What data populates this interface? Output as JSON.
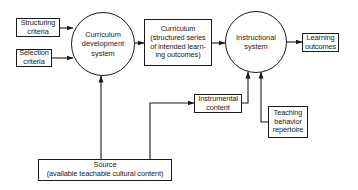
{
  "diagram": {
    "type": "flowchart",
    "nodes": {
      "structuring": {
        "shape": "box",
        "lines": [
          "Structuring",
          "criteria"
        ]
      },
      "selection": {
        "shape": "box",
        "lines": [
          "Selection",
          "criteria"
        ]
      },
      "curriculum_dev": {
        "shape": "circle",
        "lines": [
          "Curriculum",
          "development",
          "system"
        ]
      },
      "curriculum": {
        "shape": "box",
        "lines": [
          "Curriculum",
          "(structured series",
          "of intended learn-",
          "ing outcomes)"
        ]
      },
      "instructional": {
        "shape": "circle",
        "lines": [
          "Instructional",
          "system"
        ]
      },
      "learning": {
        "shape": "box",
        "lines": [
          "Learning",
          "outcomes"
        ]
      },
      "instrumental": {
        "shape": "box",
        "lines": [
          "Instrumental",
          "content"
        ]
      },
      "teaching": {
        "shape": "box",
        "lines": [
          "Teaching",
          "behavior",
          "repertoire"
        ]
      },
      "source": {
        "shape": "box",
        "lines": [
          "Source",
          "(available teachable cultural content)"
        ]
      }
    },
    "edges": [
      {
        "from": "structuring",
        "to": "curriculum_dev"
      },
      {
        "from": "selection",
        "to": "curriculum_dev"
      },
      {
        "from": "source",
        "to": "curriculum_dev"
      },
      {
        "from": "source",
        "to": "instrumental"
      },
      {
        "from": "curriculum_dev",
        "to": "curriculum"
      },
      {
        "from": "curriculum",
        "to": "instructional"
      },
      {
        "from": "instrumental",
        "to": "instructional"
      },
      {
        "from": "teaching",
        "to": "instructional"
      },
      {
        "from": "instructional",
        "to": "learning"
      }
    ]
  }
}
